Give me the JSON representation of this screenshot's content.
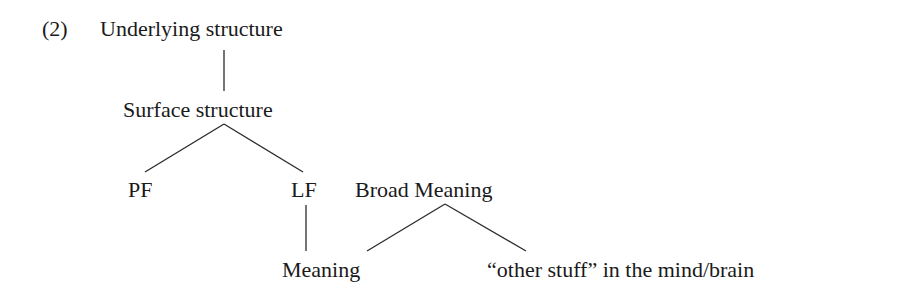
{
  "example": {
    "number": "(2)",
    "nodes": {
      "underlying": "Underlying structure",
      "surface": "Surface structure",
      "pf": "PF",
      "lf": "LF",
      "broad_meaning": "Broad Meaning",
      "meaning": "Meaning",
      "other_stuff": "“other stuff” in the mind/brain"
    },
    "edges": [
      {
        "from": "Underlying structure",
        "to": "Surface structure"
      },
      {
        "from": "Surface structure",
        "to": "PF"
      },
      {
        "from": "Surface structure",
        "to": "LF"
      },
      {
        "from": "LF",
        "to": "Meaning"
      },
      {
        "from": "Broad Meaning",
        "to": "Meaning"
      },
      {
        "from": "Broad Meaning",
        "to": "“other stuff” in the mind/brain"
      }
    ]
  }
}
